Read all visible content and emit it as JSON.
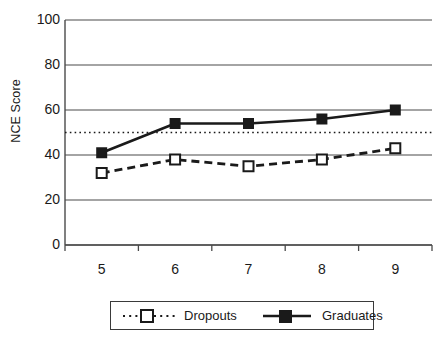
{
  "chart_data": {
    "type": "line",
    "title": "",
    "xlabel": "",
    "ylabel": "NCE Score",
    "categories": [
      "5",
      "6",
      "7",
      "8",
      "9"
    ],
    "ylim": [
      0,
      100
    ],
    "yticks": [
      0,
      20,
      40,
      60,
      80,
      100
    ],
    "ytick_labels": [
      "0",
      "20",
      "40",
      "60",
      "80",
      "100"
    ],
    "grid": true,
    "gridlines_y": [
      0,
      20,
      40,
      60,
      80,
      100
    ],
    "reference_line": {
      "value": 50,
      "style": "dotted",
      "color": "#1a1a1a"
    },
    "legend_position": "bottom",
    "series": [
      {
        "name": "Dropouts",
        "values": [
          32,
          38,
          35,
          38,
          43
        ],
        "line_style": "dashed",
        "marker": "open-square",
        "color": "#1a1a1a"
      },
      {
        "name": "Graduates",
        "values": [
          41,
          54,
          54,
          56,
          60
        ],
        "line_style": "solid",
        "marker": "filled-square",
        "color": "#1a1a1a"
      }
    ]
  },
  "axis": {
    "y_title": "NCE Score"
  },
  "legend": {
    "items": [
      {
        "label": "Dropouts"
      },
      {
        "label": "Graduates"
      }
    ]
  }
}
